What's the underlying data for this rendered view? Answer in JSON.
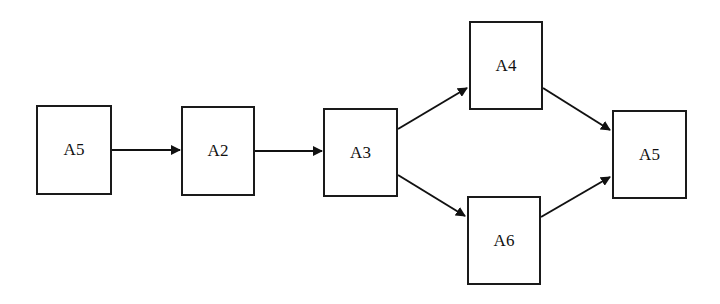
{
  "diagram": {
    "type": "flow",
    "nodes": [
      {
        "id": "n1",
        "label": "A5",
        "x": 36,
        "y": 105,
        "w": 76,
        "h": 90
      },
      {
        "id": "n2",
        "label": "A2",
        "x": 181,
        "y": 106,
        "w": 74,
        "h": 90
      },
      {
        "id": "n3",
        "label": "A3",
        "x": 323,
        "y": 108,
        "w": 75,
        "h": 89
      },
      {
        "id": "n4",
        "label": "A4",
        "x": 469,
        "y": 21,
        "w": 74,
        "h": 89
      },
      {
        "id": "n5",
        "label": "A6",
        "x": 467,
        "y": 196,
        "w": 74,
        "h": 89
      },
      {
        "id": "n6",
        "label": "A5",
        "x": 612,
        "y": 110,
        "w": 75,
        "h": 89
      }
    ],
    "edges": [
      {
        "from": "n1",
        "to": "n2"
      },
      {
        "from": "n2",
        "to": "n3"
      },
      {
        "from": "n3",
        "to": "n4"
      },
      {
        "from": "n3",
        "to": "n5"
      },
      {
        "from": "n4",
        "to": "n6"
      },
      {
        "from": "n5",
        "to": "n6"
      }
    ]
  }
}
